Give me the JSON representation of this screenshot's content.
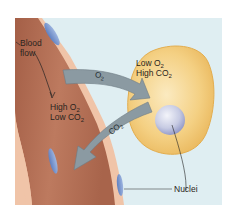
{
  "diagram": {
    "colors": {
      "background_panel": "#dfeef2",
      "vessel_fill": "#b9735a",
      "vessel_fill_dark": "#a25e47",
      "vessel_wall": "#f0c4a8",
      "endothelial_nucleus": "#7d9ad0",
      "cell_fill": "#f3cb72",
      "cell_highlight": "#f8e2a4",
      "cell_nucleus": "#c8cde6",
      "arrow_fill": "#8b9aa2",
      "arrow_stroke": "#6e7c84",
      "text": "#2a2420"
    },
    "vessel": {
      "label_line1": "Blood",
      "label_line2": "flow",
      "conc_line1_prefix": "High O",
      "conc_line1_sub": "2",
      "conc_line2_prefix": "Low CO",
      "conc_line2_sub": "2"
    },
    "cell": {
      "conc_line1_prefix": "Low O",
      "conc_line1_sub": "2",
      "conc_line2_prefix": "High CO",
      "conc_line2_sub": "2"
    },
    "arrows": {
      "o2": {
        "prefix": "O",
        "sub": "2",
        "direction": "vessel-to-cell"
      },
      "co2": {
        "prefix": "CO",
        "sub": "2",
        "direction": "cell-to-vessel"
      }
    },
    "callout": {
      "label": "Nuclei"
    }
  }
}
